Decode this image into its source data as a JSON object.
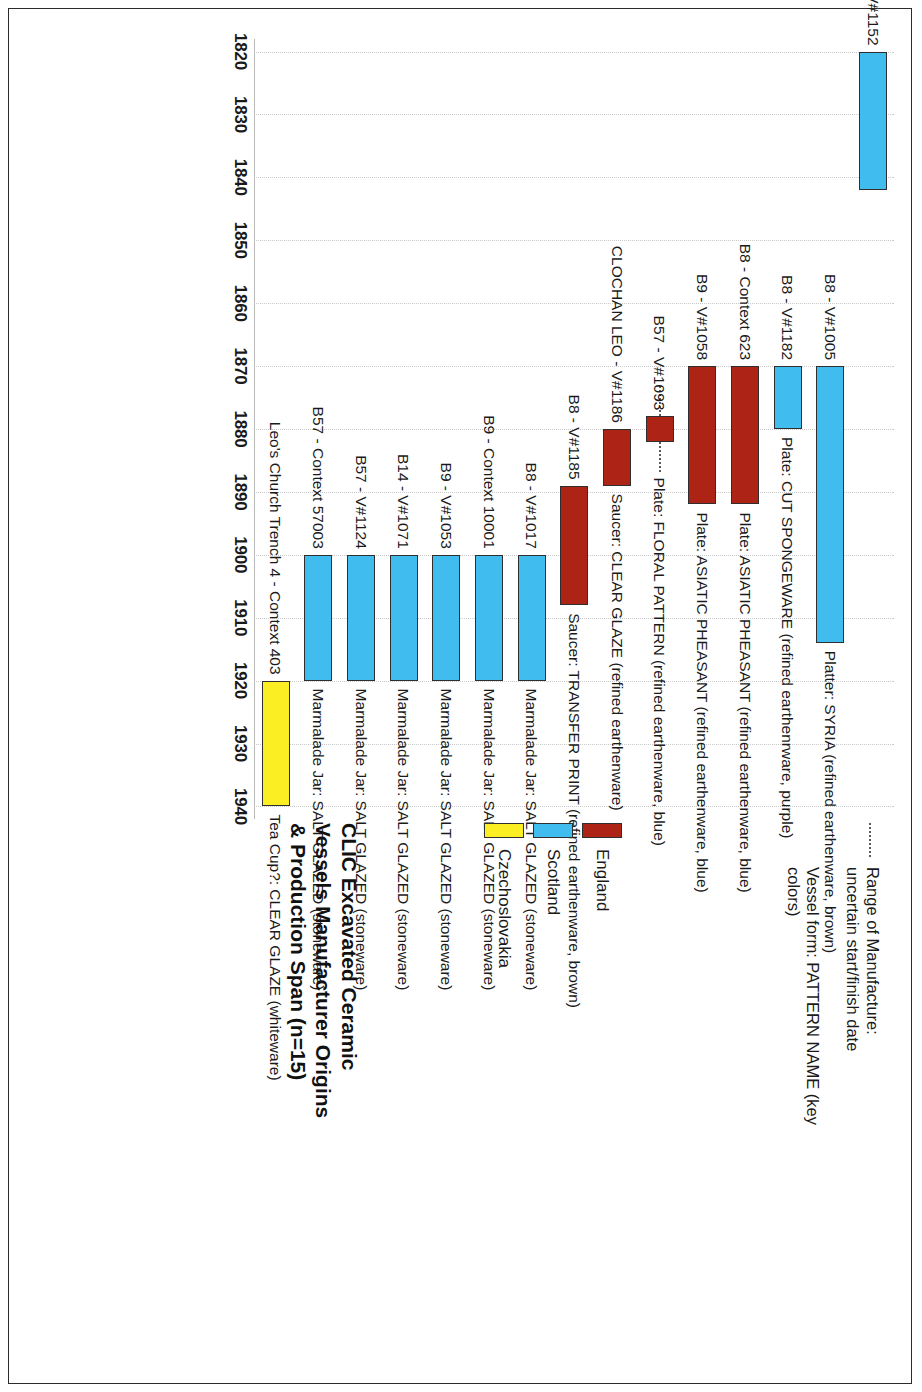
{
  "chart_data": {
    "type": "bar",
    "orientation": "rotated-90-gantt",
    "title": "CLIC Excavated Ceramic\nVessels Manufacturer Origins\n& Production Span (n=15)",
    "xlabel": "",
    "ylabel": "",
    "xlim": [
      1818,
      1942
    ],
    "ticks": [
      "1820",
      "1830",
      "1840",
      "1850",
      "1860",
      "1870",
      "1880",
      "1890",
      "1900",
      "1910",
      "1920",
      "1930",
      "1940"
    ],
    "tick_values": [
      1820,
      1830,
      1840,
      1850,
      1860,
      1870,
      1880,
      1890,
      1900,
      1910,
      1920,
      1930,
      1940
    ],
    "grid": true,
    "legend_position": "right",
    "categories": [
      "S105 - V#1152",
      "B8 - V#1005",
      "B8 - V#1182",
      "B8 - Context 623",
      "B9 - V#1058",
      "B57 - V#1093",
      "CLOCHAN LEO - V#1186",
      "B8 - V#1185",
      "B8 - V#1017",
      "B9 - Context 10001",
      "B9 - V#1053",
      "B14 - V#1071",
      "B57 - V#1124",
      "B57 - Context 57003",
      "Leo's Church Trench 4 - Context 403"
    ],
    "descriptions": [
      "",
      "Platter: SYRIA (refined earthenware, brown)",
      "Plate: CUT SPONGEWARE (refined earthenrware, purple)",
      "Plate: ASIATIC PHEASANT (refined earthenware, blue)",
      "Plate: ASIATIC PHEASANT (refined earthenware, blue)",
      "Plate: FLORAL PATTERN (refined earthenware, blue)",
      "Saucer: CLEAR GLAZE (refined earthenware)",
      "Saucer: TRANSFER PRINT (refined earthenware, brown)",
      "Marmalade Jar: SALT GLAZED (stoneware)",
      "Marmalade Jar: SALT GLAZED (stoneware)",
      "Marmalade Jar: SALT GLAZED (stoneware)",
      "Marmalade Jar: SALT GLAZED (stoneware)",
      "Marmalade Jar: SALT GLAZED (stoneware)",
      "Marmalade Jar: SALT GLAZED (stoneware)",
      "Tea Cup?: CLEAR GLAZE (whiteware)"
    ],
    "bars": [
      {
        "label": "S105 - V#1152",
        "description": "",
        "start": 1820,
        "end": 1842,
        "origin": "Scotland",
        "color": "#40BDEE",
        "uncertain": false
      },
      {
        "label": "B8 - V#1005",
        "description": "Platter: SYRIA (refined earthenware, brown)",
        "start": 1870,
        "end": 1914,
        "origin": "Scotland",
        "color": "#40BDEE",
        "uncertain": false
      },
      {
        "label": "B8 - V#1182",
        "description": "Plate: CUT SPONGEWARE (refined earthenrware, purple)",
        "start": 1870,
        "end": 1880,
        "origin": "Scotland",
        "color": "#40BDEE",
        "uncertain": false
      },
      {
        "label": "B8 - Context 623",
        "description": "Plate: ASIATIC PHEASANT (refined earthenware, blue)",
        "start": 1870,
        "end": 1892,
        "origin": "England",
        "color": "#AD2316",
        "uncertain": false
      },
      {
        "label": "B9 - V#1058",
        "description": "Plate: ASIATIC PHEASANT (refined earthenware, blue)",
        "start": 1870,
        "end": 1892,
        "origin": "England",
        "color": "#AD2316",
        "uncertain": false
      },
      {
        "label": "B57 - V#1093",
        "description": "Plate: FLORAL PATTERN (refined earthenware, blue)",
        "start": 1878,
        "end": 1882,
        "origin": "England",
        "color": "#AD2316",
        "uncertain": true
      },
      {
        "label": "CLOCHAN LEO - V#1186",
        "description": "Saucer: CLEAR GLAZE (refined earthenware)",
        "start": 1880,
        "end": 1889,
        "origin": "England",
        "color": "#AD2316",
        "uncertain": false
      },
      {
        "label": "B8 - V#1185",
        "description": "Saucer: TRANSFER PRINT (refined earthenware, brown)",
        "start": 1889,
        "end": 1908,
        "origin": "England",
        "color": "#AD2316",
        "uncertain": false
      },
      {
        "label": "B8 - V#1017",
        "description": "Marmalade Jar: SALT GLAZED (stoneware)",
        "start": 1900,
        "end": 1920,
        "origin": "Scotland",
        "color": "#40BDEE",
        "uncertain": false
      },
      {
        "label": "B9 - Context 10001",
        "description": "Marmalade Jar: SALT GLAZED (stoneware)",
        "start": 1900,
        "end": 1920,
        "origin": "Scotland",
        "color": "#40BDEE",
        "uncertain": false
      },
      {
        "label": "B9 - V#1053",
        "description": "Marmalade Jar: SALT GLAZED (stoneware)",
        "start": 1900,
        "end": 1920,
        "origin": "Scotland",
        "color": "#40BDEE",
        "uncertain": false
      },
      {
        "label": "B14 - V#1071",
        "description": "Marmalade Jar: SALT GLAZED (stoneware)",
        "start": 1900,
        "end": 1920,
        "origin": "Scotland",
        "color": "#40BDEE",
        "uncertain": false
      },
      {
        "label": "B57 - V#1124",
        "description": "Marmalade Jar: SALT GLAZED (stoneware)",
        "start": 1900,
        "end": 1920,
        "origin": "Scotland",
        "color": "#40BDEE",
        "uncertain": false
      },
      {
        "label": "B57 - Context 57003",
        "description": "Marmalade Jar: SALT GLAZED (stoneware)",
        "start": 1900,
        "end": 1920,
        "origin": "Scotland",
        "color": "#40BDEE",
        "uncertain": false
      },
      {
        "label": "Leo's Church Trench 4 - Context 403",
        "description": "Tea Cup?: CLEAR GLAZE (whiteware)",
        "start": 1920,
        "end": 1940,
        "origin": "Czechoslovakia",
        "color": "#FBEE23",
        "uncertain": false
      }
    ],
    "legend": [
      {
        "label": "England",
        "color": "#AD2316"
      },
      {
        "label": "Scotland",
        "color": "#40BDEE"
      },
      {
        "label": "Czechoslovakia",
        "color": "#FBEE23"
      }
    ],
    "notes": [
      {
        "glyph": "dotted-line",
        "text": "Range of Manufacture:\nuncertain start/finish date"
      },
      {
        "glyph": "none",
        "text": "Vessel form: PATTERN NAME (key colors)"
      }
    ]
  }
}
